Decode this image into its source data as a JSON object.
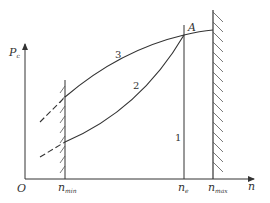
{
  "diagram": {
    "axes": {
      "y_label": "P",
      "y_label_sub": "c",
      "x_label": "n",
      "origin": "O"
    },
    "x_ticks": [
      {
        "main": "n",
        "sub": "min"
      },
      {
        "main": "n",
        "sub": "e"
      },
      {
        "main": "n",
        "sub": "max"
      }
    ],
    "point_label": "A",
    "curve_labels": {
      "curve1": "1",
      "curve2": "2",
      "curve3": "3"
    },
    "colors": {
      "line": "#333333",
      "background": "#ffffff"
    }
  }
}
